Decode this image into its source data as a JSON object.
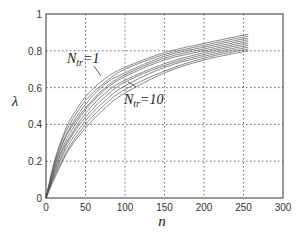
{
  "chart_data": {
    "type": "line",
    "title": "",
    "xlabel": "n",
    "ylabel": "λ",
    "xlim": [
      0,
      300
    ],
    "ylim": [
      0,
      1
    ],
    "xticks": [
      0,
      50,
      100,
      150,
      200,
      250,
      300
    ],
    "yticks": [
      0,
      0.2,
      0.4,
      0.6,
      0.8,
      1
    ],
    "xtick_labels": [
      "0",
      "50",
      "100",
      "150",
      "200",
      "250",
      "300"
    ],
    "ytick_labels": [
      "0",
      "0.2",
      "0.4",
      "0.6",
      "0.8",
      "1"
    ],
    "grid": true,
    "grid_style": "dotted",
    "line_color": "#555555",
    "x": [
      0,
      10,
      20,
      30,
      50,
      75,
      100,
      150,
      200,
      256
    ],
    "series": [
      {
        "name": "Ntr=1",
        "values": [
          0,
          0.19,
          0.32,
          0.42,
          0.55,
          0.65,
          0.71,
          0.79,
          0.84,
          0.89
        ]
      },
      {
        "name": "Ntr=2",
        "values": [
          0,
          0.18,
          0.31,
          0.4,
          0.53,
          0.63,
          0.7,
          0.78,
          0.83,
          0.88
        ]
      },
      {
        "name": "Ntr=3",
        "values": [
          0,
          0.17,
          0.29,
          0.38,
          0.51,
          0.62,
          0.68,
          0.77,
          0.82,
          0.87
        ]
      },
      {
        "name": "Ntr=4",
        "values": [
          0,
          0.16,
          0.28,
          0.37,
          0.49,
          0.6,
          0.67,
          0.76,
          0.81,
          0.86
        ]
      },
      {
        "name": "Ntr=5",
        "values": [
          0,
          0.15,
          0.26,
          0.35,
          0.48,
          0.59,
          0.66,
          0.75,
          0.8,
          0.85
        ]
      },
      {
        "name": "Ntr=6",
        "values": [
          0,
          0.14,
          0.25,
          0.33,
          0.46,
          0.57,
          0.64,
          0.73,
          0.79,
          0.84
        ]
      },
      {
        "name": "Ntr=7",
        "values": [
          0,
          0.13,
          0.23,
          0.32,
          0.44,
          0.55,
          0.63,
          0.72,
          0.78,
          0.83
        ]
      },
      {
        "name": "Ntr=8",
        "values": [
          0,
          0.12,
          0.22,
          0.3,
          0.42,
          0.53,
          0.61,
          0.71,
          0.77,
          0.82
        ]
      },
      {
        "name": "Ntr=9",
        "values": [
          0,
          0.11,
          0.2,
          0.28,
          0.4,
          0.51,
          0.59,
          0.69,
          0.76,
          0.81
        ]
      },
      {
        "name": "Ntr=10",
        "values": [
          0,
          0.1,
          0.19,
          0.27,
          0.38,
          0.49,
          0.57,
          0.68,
          0.75,
          0.8
        ]
      }
    ],
    "annotations": [
      {
        "text_main": "N",
        "text_sub": "tr",
        "text_rest": "=1",
        "label": "Ntr=1",
        "points_to": "top curve"
      },
      {
        "text_main": "N",
        "text_sub": "tr",
        "text_rest": "=10",
        "label": "Ntr=10",
        "points_to": "bottom curve"
      }
    ]
  }
}
